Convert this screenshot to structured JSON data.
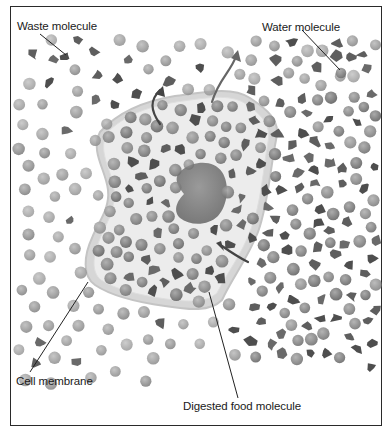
{
  "diagram": {
    "type": "cell diffusion illustration",
    "labels": {
      "waste": "Waste molecule",
      "water": "Water molecule",
      "membrane": "Cell membrane",
      "food": "Digested food molecule"
    },
    "colors": {
      "frame": "#2a2a2a",
      "cytoplasm": "#e6e6e6",
      "membrane": "#cfcfcf",
      "nucleus": "#8a8a8a",
      "water_molecule": "#9a9a9a",
      "waste_molecule": "#5a5a5a",
      "arrow": "#444444"
    }
  }
}
